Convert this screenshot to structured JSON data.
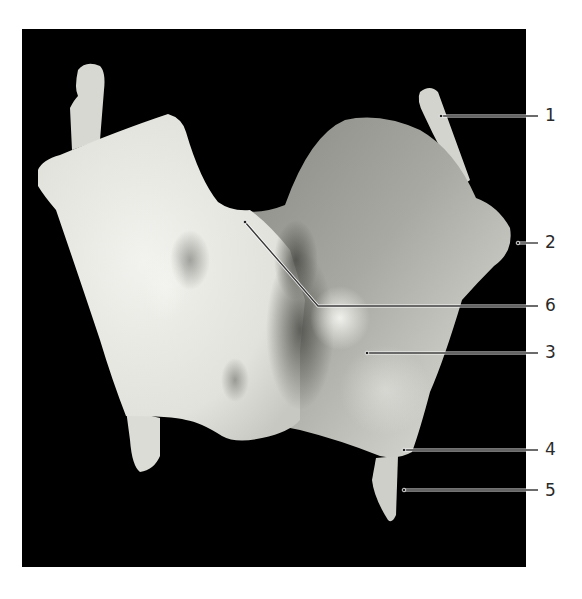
{
  "figure": {
    "type": "anatomical photograph",
    "background_color": "#000000",
    "page_color": "#ffffff",
    "labels": [
      {
        "text": "1",
        "y": 116
      },
      {
        "text": "2",
        "y": 242
      },
      {
        "text": "6",
        "y": 306
      },
      {
        "text": "3",
        "y": 353
      },
      {
        "text": "4",
        "y": 450
      },
      {
        "text": "5",
        "y": 491
      }
    ]
  }
}
